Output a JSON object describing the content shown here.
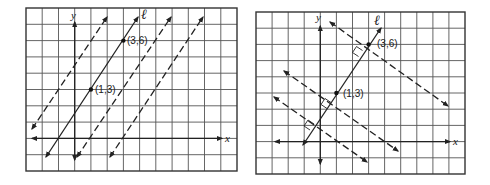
{
  "figures": [
    {
      "id": "left",
      "title": "Lines parallel to line l",
      "axis_labels": {
        "x": "x",
        "y": "y"
      },
      "line_label": "ℓ",
      "points": [
        {
          "label": "(1,3)",
          "x": 1,
          "y": 3
        },
        {
          "label": "(3,6)",
          "x": 3,
          "y": 6
        }
      ],
      "line_l": {
        "slope": 1.5,
        "style": "solid"
      },
      "other_lines": {
        "count": 3,
        "relation": "parallel",
        "style": "dashed"
      }
    },
    {
      "id": "right",
      "title": "Lines perpendicular to line l",
      "axis_labels": {
        "x": "x",
        "y": "y"
      },
      "line_label": "ℓ",
      "points": [
        {
          "label": "(1,3)",
          "x": 1,
          "y": 3
        },
        {
          "label": "(3,6)",
          "x": 3,
          "y": 6
        }
      ],
      "line_l": {
        "slope": 1.5,
        "style": "solid"
      },
      "other_lines": {
        "count": 3,
        "relation": "perpendicular",
        "style": "dashed",
        "slope": -0.6667
      }
    }
  ]
}
